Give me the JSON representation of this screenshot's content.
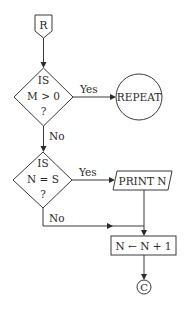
{
  "diagram": {
    "type": "flowchart",
    "colors": {
      "stroke": "#3a3a3a",
      "text": "#2a2a2a",
      "background": "#ffffff"
    },
    "nodes": {
      "start_connector": {
        "label": "R",
        "shape": "off-page-connector"
      },
      "decision1": {
        "line1": "IS",
        "line2": "M > 0",
        "line3": "?",
        "shape": "diamond"
      },
      "repeat": {
        "label": "REPEAT",
        "shape": "circle"
      },
      "decision2": {
        "line1": "IS",
        "line2": "N = S",
        "line3": "?",
        "shape": "diamond"
      },
      "print": {
        "label": "PRINT N",
        "shape": "parallelogram"
      },
      "increment": {
        "label": "N ← N + 1",
        "shape": "rectangle"
      },
      "end_connector": {
        "label": "C",
        "shape": "circle-connector"
      }
    },
    "edges": {
      "d1_yes": {
        "label": "Yes"
      },
      "d1_no": {
        "label": "No"
      },
      "d2_yes": {
        "label": "Yes"
      },
      "d2_no": {
        "label": "No"
      }
    }
  }
}
